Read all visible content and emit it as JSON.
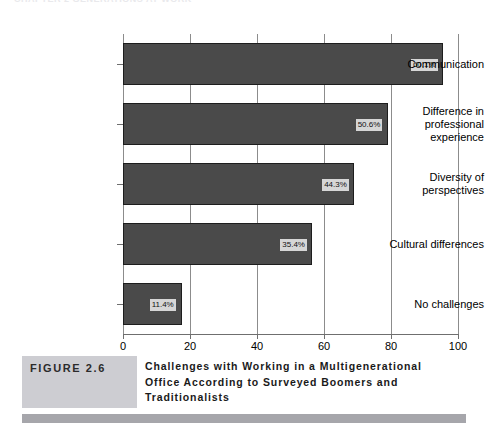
{
  "running_header": {
    "text": "CHAPTER  2   GENERATIONS AT WORK"
  },
  "caption": {
    "figure_tag": "FIGURE 2.6",
    "title_line_1": "Challenges with Working in a Multigenerational",
    "title_line_2": "Office According to Surveyed Boomers and",
    "title_line_3": "Traditionalists"
  },
  "colors": {
    "bar_fill": "#4a4a4a",
    "bar_outline": "#1d1d1d",
    "value_box": "#d6d6d6",
    "gridline": "#8c8c8c",
    "caption_tag_bg": "#cdcdd2",
    "bottom_rule": "#a6a6ab"
  },
  "chart_data": {
    "type": "bar",
    "orientation": "horizontal",
    "title": "Challenges with Working in a Multigenerational Office According to Surveyed Boomers and Traditionalists",
    "xlabel": "",
    "ylabel": "",
    "xlim": [
      0,
      100
    ],
    "xticks": [
      0,
      20,
      40,
      60,
      80,
      100
    ],
    "xtick_labels": [
      "0",
      "20",
      "40",
      "60",
      "80",
      "100"
    ],
    "grid": true,
    "grid_axis": "x",
    "legend": false,
    "categories": [
      "Communication",
      "Difference in professional experience",
      "Diversity of perspectives",
      "Cultural differences",
      "No challenges"
    ],
    "category_label_lines": [
      [
        "Communication"
      ],
      [
        "Difference in",
        "professional",
        "experience"
      ],
      [
        "Diversity of",
        "perspectives"
      ],
      [
        "Cultural differences"
      ],
      [
        "No challenges"
      ]
    ],
    "values": [
      60.1,
      50.6,
      44.3,
      35.4,
      11.4
    ],
    "value_labels": [
      "60.1%",
      "50.6%",
      "44.3%",
      "35.4%",
      "11.4%"
    ],
    "drawn_bar_extent": [
      95.5,
      79.0,
      69.0,
      56.5,
      17.5
    ]
  }
}
